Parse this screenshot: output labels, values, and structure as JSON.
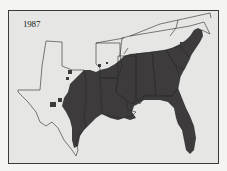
{
  "map": {
    "year_label": "1987",
    "colors": {
      "background": "#e6e6e4",
      "occupied_region": "#3d3b3c",
      "state_outline": "#2a2a2a",
      "frame": "#3a3a3a"
    },
    "region_depicted": "Southeastern United States",
    "states_outlined": [
      "Texas",
      "Oklahoma",
      "Arkansas",
      "Louisiana",
      "Mississippi",
      "Alabama",
      "Georgia",
      "Florida",
      "Tennessee",
      "Kentucky",
      "South Carolina",
      "North Carolina",
      "Virginia"
    ],
    "legend": "Shaded area indicates range extent in 1987"
  }
}
